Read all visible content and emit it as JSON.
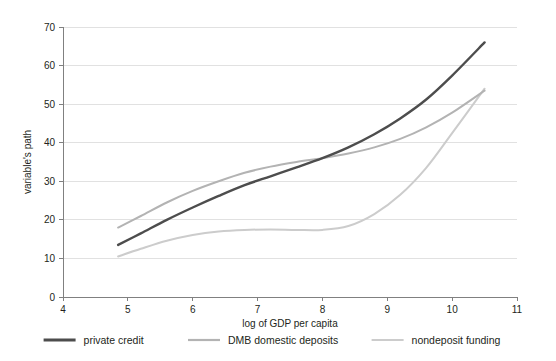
{
  "chart_data": {
    "type": "line",
    "title": "",
    "xlabel": "log of GDP per capita",
    "ylabel": "variable's path",
    "xlim": [
      4,
      11
    ],
    "ylim": [
      0,
      70
    ],
    "xticks": [
      4,
      5,
      6,
      7,
      8,
      9,
      10,
      11
    ],
    "yticks": [
      0,
      10,
      20,
      30,
      40,
      50,
      60,
      70
    ],
    "grid": true,
    "legend_position": "bottom",
    "x": [
      4.85,
      5.2,
      5.6,
      6.0,
      6.4,
      6.8,
      7.2,
      7.6,
      8.0,
      8.4,
      8.8,
      9.2,
      9.6,
      10.0,
      10.5
    ],
    "series": [
      {
        "name": "private credit",
        "color": "#4d4d4d",
        "values": [
          13.5,
          16.5,
          20.0,
          23.2,
          26.2,
          29.0,
          31.3,
          33.6,
          36.0,
          38.8,
          42.2,
          46.3,
          51.2,
          57.4,
          66.0
        ]
      },
      {
        "name": "DMB domestic deposits",
        "color": "#b3b3b3",
        "values": [
          18.0,
          21.0,
          24.5,
          27.5,
          30.0,
          32.2,
          33.8,
          35.0,
          36.0,
          37.2,
          38.8,
          41.0,
          44.0,
          47.8,
          53.5
        ]
      },
      {
        "name": "nondeposit funding",
        "color": "#cccccc",
        "values": [
          10.5,
          12.5,
          14.6,
          16.1,
          17.0,
          17.4,
          17.5,
          17.4,
          17.4,
          18.4,
          21.5,
          26.5,
          33.5,
          42.5,
          54.0
        ]
      }
    ]
  },
  "axes": {
    "y_title": "variable's path",
    "x_title": "log of GDP per capita",
    "x_tick_labels": [
      "4",
      "5",
      "6",
      "7",
      "8",
      "9",
      "10",
      "11"
    ],
    "y_tick_labels": [
      "0",
      "10",
      "20",
      "30",
      "40",
      "50",
      "60",
      "70"
    ]
  },
  "legend": {
    "items": [
      {
        "label": "private credit",
        "color": "#4d4d4d"
      },
      {
        "label": "DMB domestic deposits",
        "color": "#b3b3b3"
      },
      {
        "label": "nondeposit funding",
        "color": "#cccccc"
      }
    ]
  }
}
